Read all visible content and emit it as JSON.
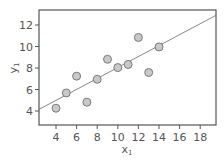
{
  "chart_data": {
    "type": "scatter",
    "title": "",
    "xlabel": "x1",
    "ylabel": "y1",
    "xlim": [
      2.3,
      19.8
    ],
    "ylim": [
      2.7,
      13.4
    ],
    "xticks": [
      4,
      6,
      8,
      10,
      12,
      14,
      16,
      18
    ],
    "yticks": [
      4,
      6,
      8,
      10,
      12
    ],
    "grid": false,
    "legend": null,
    "points": {
      "x": [
        10,
        8,
        13,
        9,
        11,
        14,
        6,
        4,
        12,
        7,
        5
      ],
      "y": [
        8.04,
        6.95,
        7.58,
        8.81,
        8.33,
        9.96,
        7.24,
        4.26,
        10.84,
        4.82,
        5.68
      ]
    },
    "fit_line": {
      "intercept": 3.0,
      "slope": 0.5,
      "x_range": [
        2.3,
        19.8
      ]
    },
    "colors": {
      "point_fill": "#c8c8c8",
      "point_edge": "#7a7a7a",
      "line": "#6a6a6a",
      "axes": "#555555"
    }
  },
  "labels": {
    "x": "x",
    "x_sub": "1",
    "y": "y",
    "y_sub": "1"
  }
}
